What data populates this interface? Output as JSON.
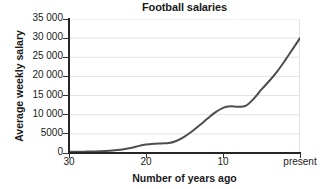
{
  "chart_data": {
    "type": "line",
    "title": "Football salaries",
    "xlabel": "Number of years ago",
    "ylabel": "Average weekly salary",
    "grid": "horizontal",
    "legend": "none",
    "x_ticks": [
      "30",
      "20",
      "10",
      "present"
    ],
    "x_tick_values": [
      30,
      20,
      10,
      0
    ],
    "xlim": [
      30,
      0
    ],
    "x_axis_direction": "reversed",
    "y_ticks": [
      "0",
      "5000",
      "10 000",
      "15 000",
      "20 000",
      "25 000",
      "30 000",
      "35 000"
    ],
    "y_tick_values": [
      0,
      5000,
      10000,
      15000,
      20000,
      25000,
      30000,
      35000
    ],
    "ylim": [
      0,
      35000
    ],
    "series": [
      {
        "name": "Average weekly salary",
        "color": "#4d4d4d",
        "x": [
          30,
          28,
          26,
          24,
          22,
          21,
          20,
          19,
          18,
          17,
          16,
          15,
          14,
          13,
          12,
          11,
          10,
          9,
          8,
          7,
          6,
          5,
          4,
          3,
          2,
          1,
          0
        ],
        "y": [
          300,
          350,
          450,
          700,
          1300,
          1800,
          2200,
          2400,
          2500,
          2600,
          3200,
          4300,
          5700,
          7300,
          9000,
          10600,
          11800,
          12200,
          12100,
          12400,
          14200,
          16600,
          18800,
          21200,
          24000,
          27000,
          30000
        ]
      }
    ]
  }
}
